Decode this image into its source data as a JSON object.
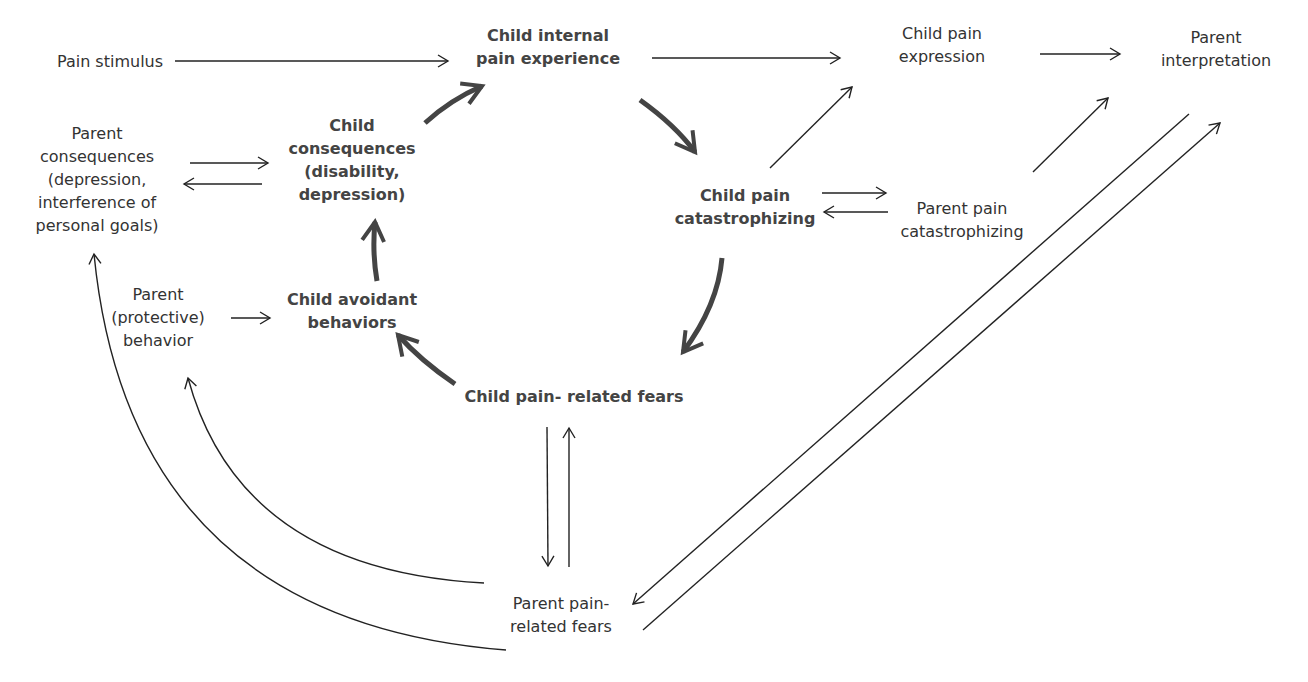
{
  "diagram": {
    "type": "causal-model",
    "colors": {
      "text": "#333333",
      "bold_text": "#444444",
      "thin_arrow": "#222222",
      "thick_arrow": "#444444",
      "background": "#ffffff"
    },
    "nodes": {
      "pain_stimulus": {
        "lines": [
          "Pain stimulus"
        ],
        "bold": false
      },
      "child_internal": {
        "lines": [
          "Child internal",
          "pain experience"
        ],
        "bold": true
      },
      "child_expression": {
        "lines": [
          "Child pain",
          "expression"
        ],
        "bold": false
      },
      "parent_interpretation": {
        "lines": [
          "Parent",
          "interpretation"
        ],
        "bold": false
      },
      "parent_consequences": {
        "lines": [
          "Parent",
          "consequences",
          "(depression,",
          "interference of",
          "personal goals)"
        ],
        "bold": false
      },
      "child_consequences": {
        "lines": [
          "Child",
          "consequences",
          "(disability,",
          "depression)"
        ],
        "bold": true
      },
      "child_catastrophizing": {
        "lines": [
          "Child pain",
          "catastrophizing"
        ],
        "bold": true
      },
      "parent_catastrophizing": {
        "lines": [
          "Parent pain",
          "catastrophizing"
        ],
        "bold": false
      },
      "parent_protective": {
        "lines": [
          "Parent",
          "(protective)",
          "behavior"
        ],
        "bold": false
      },
      "child_avoidant": {
        "lines": [
          "Child avoidant",
          "behaviors"
        ],
        "bold": true
      },
      "child_fears": {
        "lines": [
          "Child pain- related fears"
        ],
        "bold": true
      },
      "parent_fears": {
        "lines": [
          "Parent pain-",
          "related fears"
        ],
        "bold": false
      }
    },
    "edges": [
      {
        "from": "Pain stimulus",
        "to": "Child internal pain experience",
        "style": "thin"
      },
      {
        "from": "Child internal pain experience",
        "to": "Child pain expression",
        "style": "thin"
      },
      {
        "from": "Child pain expression",
        "to": "Parent interpretation",
        "style": "thin"
      },
      {
        "from": "Child internal pain experience",
        "to": "Child pain catastrophizing",
        "style": "thick"
      },
      {
        "from": "Child pain catastrophizing",
        "to": "Child pain- related fears",
        "style": "thick"
      },
      {
        "from": "Child pain- related fears",
        "to": "Child avoidant behaviors",
        "style": "thick"
      },
      {
        "from": "Child avoidant behaviors",
        "to": "Child consequences",
        "style": "thick"
      },
      {
        "from": "Child consequences",
        "to": "Child internal pain experience",
        "style": "thick"
      },
      {
        "from": "Parent consequences",
        "to": "Child consequences",
        "style": "thin"
      },
      {
        "from": "Child consequences",
        "to": "Parent consequences",
        "style": "thin"
      },
      {
        "from": "Child pain catastrophizing",
        "to": "Child pain expression",
        "style": "thin"
      },
      {
        "from": "Child pain catastrophizing",
        "to": "Parent pain catastrophizing",
        "style": "thin"
      },
      {
        "from": "Parent pain catastrophizing",
        "to": "Child pain catastrophizing",
        "style": "thin"
      },
      {
        "from": "Parent pain catastrophizing",
        "to": "Parent interpretation",
        "style": "thin"
      },
      {
        "from": "Parent interpretation",
        "to": "Parent pain-related fears",
        "style": "thin"
      },
      {
        "from": "Parent pain-related fears",
        "to": "Parent interpretation",
        "style": "thin"
      },
      {
        "from": "Parent (protective) behavior",
        "to": "Child avoidant behaviors",
        "style": "thin"
      },
      {
        "from": "Child pain- related fears",
        "to": "Parent pain-related fears",
        "style": "thin"
      },
      {
        "from": "Parent pain-related fears",
        "to": "Child pain- related fears",
        "style": "thin"
      },
      {
        "from": "Parent pain-related fears",
        "to": "Parent (protective) behavior",
        "style": "thin"
      },
      {
        "from": "Parent pain-related fears",
        "to": "Parent consequences",
        "style": "thin"
      }
    ]
  }
}
